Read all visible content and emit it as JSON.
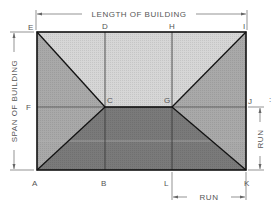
{
  "diagram": {
    "type": "hip-roof-plan",
    "dimensions": {
      "length_label": "LENGTH OF BUILDING",
      "span_label": "SPAN OF BUILDING",
      "run_right_label": "RUN",
      "run_bottom_label": "RUN"
    },
    "points": {
      "E": "E",
      "D": "D",
      "H": "H",
      "I": "I",
      "F": "F",
      "C": "C",
      "G": "G",
      "J": "J",
      "A": "A",
      "B": "B",
      "L": "L",
      "K": "K"
    },
    "colors": {
      "top_plane": "#d6d6d6",
      "side_planes": "#a9a9a9",
      "bottom_plane": "#7a7a7a",
      "outline": "#222222",
      "dimension_line": "#666666"
    }
  }
}
